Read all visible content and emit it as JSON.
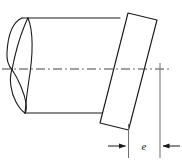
{
  "figure": {
    "type": "engineering-line-drawing",
    "background_color": "#ffffff",
    "line_color": "#1a1a1a",
    "centerline_color": "#3a3a3a"
  },
  "labels": {
    "dimension_e": "e"
  },
  "geometry": {
    "canvas": {
      "width": 182,
      "height": 168
    },
    "cylinder": {
      "top_line": {
        "x1": 22,
        "y1": 18,
        "x2": 120,
        "y2": 18
      },
      "bottom_line": {
        "x1": 25,
        "y1": 113,
        "x2": 109,
        "y2": 113
      },
      "left_cap_outer": "M22,18 C10,24 7,40 7,55 C7,62 9,66 12,69",
      "left_cap_outer_lower": "M12,69 C9,78 13,95 18,104 C20,108 23,112 25,113",
      "left_ellipse_upper": "M12,69 C15,58 22,38 27,25 C28,22 29,20 30,18",
      "left_ellipse_lower": "M12,69 C20,80 26,95 27,104 C27,109 26,112 25,113",
      "seam_curve": "M30,18 C38,35 34,60 25,113"
    },
    "centerline": {
      "x1": 2,
      "y1": 69,
      "x2": 171,
      "y2": 69,
      "style": "dash-dot"
    },
    "plate": {
      "corners": [
        {
          "x": 128,
          "y": 13
        },
        {
          "x": 157,
          "y": 20
        },
        {
          "x": 128,
          "y": 130
        },
        {
          "x": 100,
          "y": 123
        }
      ],
      "description": "inclined rectangular plate"
    },
    "dimension": {
      "extension_left": {
        "x": 128,
        "y1": 125,
        "y2": 158
      },
      "extension_right": {
        "x": 160,
        "y1": 64,
        "y2": 158
      },
      "dim_line_y": 146,
      "arrow_left": {
        "from_x": 108,
        "to_x": 127
      },
      "arrow_right": {
        "from_x": 180,
        "to_x": 161
      },
      "label_x": 144,
      "label_y": 149
    }
  }
}
